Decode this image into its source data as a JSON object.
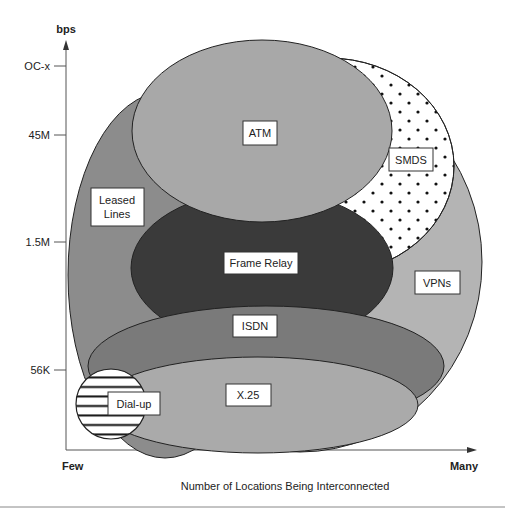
{
  "diagram": {
    "y_axis": {
      "label": "bps",
      "ticks": [
        {
          "label": "OC-x",
          "y": 66
        },
        {
          "label": "45M",
          "y": 135
        },
        {
          "label": "1.5M",
          "y": 242
        },
        {
          "label": "56K",
          "y": 370
        }
      ]
    },
    "x_axis": {
      "label": "Number of Locations Being Interconnected",
      "min_label": "Few",
      "max_label": "Many"
    },
    "regions": {
      "atm": {
        "label": "ATM",
        "fill": "#a8a8a8"
      },
      "smds": {
        "label": "SMDS",
        "fill": "#ffffff",
        "pattern": "dots"
      },
      "leased_lines": {
        "label_line1": "Leased",
        "label_line2": "Lines",
        "fill": "#8c8c8c"
      },
      "vpns": {
        "label": "VPNs",
        "fill": "#b4b4b4"
      },
      "frame_relay": {
        "label": "Frame Relay",
        "fill": "#3a3a3a"
      },
      "isdn": {
        "label": "ISDN",
        "fill": "#7a7a7a"
      },
      "x25": {
        "label": "X.25",
        "fill": "#aaaaaa"
      },
      "dialup": {
        "label": "Dial-up",
        "fill": "#ffffff",
        "pattern": "horizontal-lines"
      }
    }
  }
}
